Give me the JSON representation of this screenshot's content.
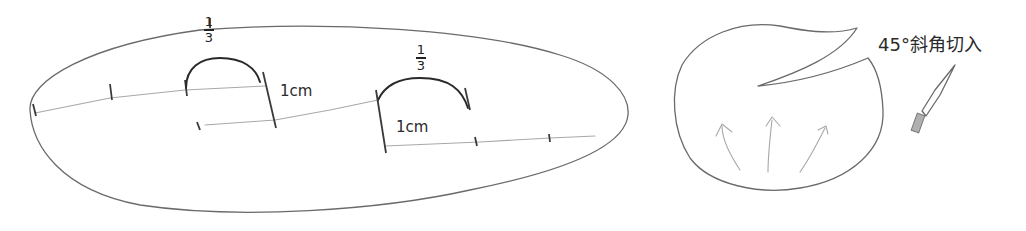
{
  "diagram": {
    "left_figure": {
      "shape": "elongated-oval",
      "fraction_labels": [
        {
          "numerator": "1",
          "denominator": "3"
        },
        {
          "numerator": "1",
          "denominator": "3"
        }
      ],
      "measurement_labels": [
        "1cm",
        "1cm"
      ]
    },
    "right_figure": {
      "shape": "round-with-diagonal-cut",
      "annotation": "45°斜角切入",
      "arrows_count": 3,
      "tool_icon": "knife"
    },
    "colors": {
      "stroke": "#6a6a6a",
      "stroke_dark": "#2a2a2a",
      "stroke_light": "#a8a8a8",
      "background": "#ffffff"
    }
  }
}
